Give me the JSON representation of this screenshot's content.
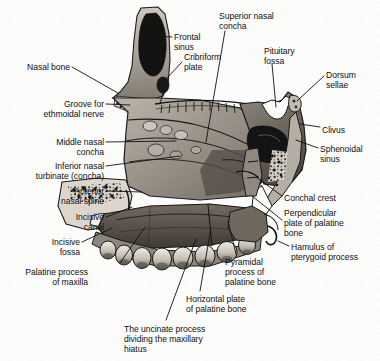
{
  "figure": {
    "background": "#ffffff",
    "ink": "#111111",
    "width": 380,
    "height": 361
  },
  "labels": [
    {
      "id": "nasal-bone",
      "text": "Nasal bone",
      "x": 70,
      "y": 62,
      "align": "right"
    },
    {
      "id": "frontal-sinus",
      "text": "Frontal\nsinus",
      "x": 174,
      "y": 32,
      "align": "left"
    },
    {
      "id": "cribriform-plate",
      "text": "Cribriform\nplate",
      "x": 184,
      "y": 52,
      "align": "left"
    },
    {
      "id": "superior-nasal-concha",
      "text": "Superior nasal\nconcha",
      "x": 219,
      "y": 11,
      "align": "left"
    },
    {
      "id": "pituitary-fossa",
      "text": "Pituitary\nfossa",
      "x": 264,
      "y": 46,
      "align": "left"
    },
    {
      "id": "dorsum-sellae",
      "text": "Dorsum\nsellae",
      "x": 326,
      "y": 70,
      "align": "left"
    },
    {
      "id": "clivus",
      "text": "Clivus",
      "x": 322,
      "y": 125,
      "align": "left"
    },
    {
      "id": "sphenoidal-sinus",
      "text": "Sphenoidal\nsinus",
      "x": 320,
      "y": 144,
      "align": "left"
    },
    {
      "id": "groove-ethmoidal-nerve",
      "text": "Groove for\nethmoidal nerve",
      "x": 104,
      "y": 99,
      "align": "right"
    },
    {
      "id": "middle-nasal-concha",
      "text": "Middle nasal\nconcha",
      "x": 104,
      "y": 137,
      "align": "right"
    },
    {
      "id": "inferior-nasal-turbinate",
      "text": "Inferior nasal\nturbinate (concha)",
      "x": 104,
      "y": 161,
      "align": "right"
    },
    {
      "id": "anterior-nasal-spine",
      "text": "Anterior\nnasal spine",
      "x": 104,
      "y": 186,
      "align": "right"
    },
    {
      "id": "incisive-canal",
      "text": "Incisive\ncanal",
      "x": 104,
      "y": 212,
      "align": "right"
    },
    {
      "id": "incisive-fossa",
      "text": "Incisive\nfossa",
      "x": 80,
      "y": 237,
      "align": "right"
    },
    {
      "id": "palatine-process-maxilla",
      "text": "Palatine process\nof maxilla",
      "x": 88,
      "y": 267,
      "align": "right"
    },
    {
      "id": "conchal-crest",
      "text": "Conchal crest",
      "x": 284,
      "y": 193,
      "align": "left"
    },
    {
      "id": "perpendicular-plate-palatine",
      "text": "Perpendicular\nplate of palatine\nbone",
      "x": 284,
      "y": 208,
      "align": "left"
    },
    {
      "id": "hamulus-pterygoid",
      "text": "Hamulus of\npterygoid process",
      "x": 291,
      "y": 242,
      "align": "left"
    },
    {
      "id": "pyramidal-process-palatine",
      "text": "Pyramidal\nprocess of\npalatine bone",
      "x": 225,
      "y": 257,
      "align": "left"
    },
    {
      "id": "horizontal-plate-palatine",
      "text": "Horizontal plate\nof palatine bone",
      "x": 186,
      "y": 294,
      "align": "left"
    },
    {
      "id": "uncinate-process",
      "text": "The uncinate process\ndividing the maxillary\nhiatus",
      "x": 124,
      "y": 324,
      "align": "left"
    }
  ],
  "leaders": [
    {
      "id": "leader-nasal-bone",
      "points": "72,67 118,93"
    },
    {
      "id": "leader-frontal-sinus",
      "points": "172,37 146,36"
    },
    {
      "id": "leader-cribriform-plate",
      "points": "182,62 167,78 160,104"
    },
    {
      "id": "leader-superior-nasal-concha",
      "points": "225,31 206,142"
    },
    {
      "id": "leader-pituitary-fossa",
      "points": "272,64 276,107"
    },
    {
      "id": "leader-dorsum-sellae",
      "points": "324,76 297,101"
    },
    {
      "id": "leader-clivus",
      "points": "320,127 300,124"
    },
    {
      "id": "leader-sphenoidal-sinus",
      "points": "318,148 296,140"
    },
    {
      "id": "leader-groove-ethmoidal",
      "points": "106,104 130,105"
    },
    {
      "id": "leader-middle-nasal-concha",
      "points": "106,142 176,141"
    },
    {
      "id": "leader-inferior-turbinate",
      "points": "106,166 180,156"
    },
    {
      "id": "leader-anterior-nasal-spine",
      "points": "106,191 142,192"
    },
    {
      "id": "leader-incisive-canal",
      "points": "106,217 132,207"
    },
    {
      "id": "leader-incisive-fossa",
      "points": "82,242 112,228"
    },
    {
      "id": "leader-palatine-process",
      "points": "120,263 145,227"
    },
    {
      "id": "leader-conchal-crest",
      "points": "282,196 256,177"
    },
    {
      "id": "leader-perpendicular-plate",
      "points": "282,220 252,196"
    },
    {
      "id": "leader-hamulus",
      "points": "289,246 278,241"
    },
    {
      "id": "leader-pyramidal-process",
      "points": "236,254 228,221"
    },
    {
      "id": "leader-horizontal-plate",
      "points": "200,291 211,228"
    },
    {
      "id": "leader-uncinate-process",
      "points": "166,320 196,239"
    }
  ]
}
